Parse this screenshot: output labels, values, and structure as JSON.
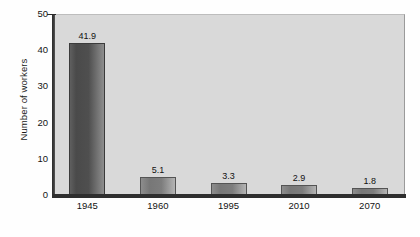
{
  "chart_data": {
    "type": "bar",
    "title": "",
    "subtitle": "",
    "xlabel": "",
    "ylabel": "Number of workers",
    "categories": [
      "1945",
      "1960",
      "1995",
      "2010",
      "2070"
    ],
    "values": [
      41.9,
      5.1,
      3.3,
      2.9,
      1.8
    ],
    "value_labels": [
      "41.9",
      "5.1",
      "3.3",
      "2.9",
      "1.8"
    ],
    "ylim": [
      0,
      50
    ],
    "yticks": [
      0,
      10,
      20,
      30,
      40,
      50
    ],
    "ytick_labels": [
      "0",
      "10",
      "20",
      "30",
      "40",
      "50"
    ],
    "grid": false,
    "legend": false,
    "legend_position": "none",
    "series": [
      {
        "name": "Number of workers",
        "values": [
          41.9,
          5.1,
          3.3,
          2.9,
          1.8
        ]
      }
    ]
  },
  "style": {
    "plot_background": "#d9d9d9",
    "page_background": "#ffffff",
    "bar_color_dark": "#4a4a4a",
    "bar_color_light": "#8e8e8e",
    "axis_color": "#2e2e2e",
    "text_color": "#121212"
  },
  "watermark": {
    "text": ""
  }
}
